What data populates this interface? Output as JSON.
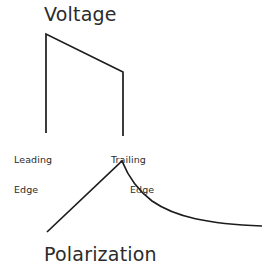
{
  "figure": {
    "background_color": "#ffffff",
    "stroke_color": "#1c1c1c",
    "text_color": "#2b2b2b",
    "width": 262,
    "height": 272
  },
  "labels": {
    "voltage": "Voltage",
    "polarization": "Polarization",
    "leading_edge_line1": "Leading",
    "leading_edge_line2": "Edge",
    "trailing_edge_line1": "Trailing",
    "trailing_edge_line2": "Edge"
  },
  "chart_data": {
    "type": "line",
    "title": "Voltage",
    "xlabel": "",
    "ylabel": "",
    "grid": false,
    "legend": "none",
    "annotations": [
      {
        "text": "Leading Edge",
        "x": 47,
        "y": 140
      },
      {
        "text": "Trailing Edge",
        "x": 123,
        "y": 140
      },
      {
        "text": "Voltage",
        "x": 95,
        "y": 16
      },
      {
        "text": "Polarization",
        "x": 110,
        "y": 256
      }
    ],
    "series": [
      {
        "name": "Voltage",
        "description": "Square-ish pulse: sharp leading-edge rise, slightly drooping flat top, sharp trailing-edge fall",
        "points": [
          {
            "x": 46,
            "y": 133
          },
          {
            "x": 46,
            "y": 34
          },
          {
            "x": 123,
            "y": 72
          },
          {
            "x": 123,
            "y": 136
          }
        ]
      },
      {
        "name": "Polarization",
        "description": "Linear ramp up during pulse, peaking at the trailing edge, then exponential decay toward baseline",
        "path": "M 47 232 L 122 161 C 128 176 136 189 152 201 C 175 217 208 224 262 226",
        "points": [
          {
            "x": 47,
            "y": 232
          },
          {
            "x": 122,
            "y": 161
          },
          {
            "x": 152,
            "y": 201
          },
          {
            "x": 200,
            "y": 220
          },
          {
            "x": 262,
            "y": 226
          }
        ]
      }
    ]
  }
}
